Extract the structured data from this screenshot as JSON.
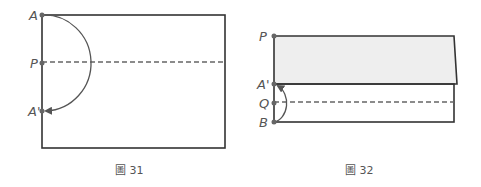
{
  "figure31": {
    "caption": "圖 31",
    "labels": {
      "a": "A",
      "p": "P",
      "a_prime": "A'"
    }
  },
  "figure32": {
    "caption": "圖 32",
    "labels": {
      "p": "P",
      "a_prime": "A'",
      "q": "Q",
      "b": "B"
    }
  },
  "colors": {
    "line": "#333333",
    "dash": "#666666",
    "point": "#666666",
    "flap_fill": "#eeeeee",
    "text": "#555555"
  }
}
